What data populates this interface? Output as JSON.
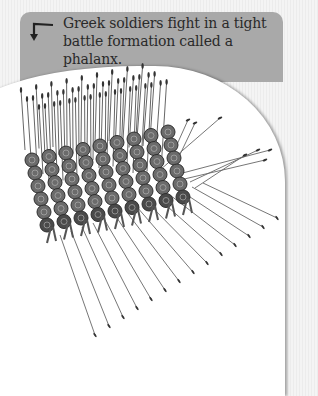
{
  "caption": {
    "line1": "Greek soldiers fight in a tight",
    "line2": "battle formation called a phalanx.",
    "icon": "arrow-down-left-icon"
  },
  "illustration": {
    "subject": "phalanx-of-greek-soldiers",
    "colors": {
      "caption_bg": "#a9a9a9",
      "page_bg": "#ffffff",
      "text": "#2a2a2a",
      "figure": "#555555"
    }
  }
}
